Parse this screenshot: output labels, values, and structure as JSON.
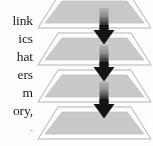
{
  "page": {
    "kind": "scanned-figure-fragment",
    "width": 153,
    "height": 146,
    "background": "#fdfdfc"
  },
  "text_column": {
    "name": "clipped-body-text",
    "alignment": "right",
    "lines": [
      {
        "text": "link",
        "top": 16
      },
      {
        "text": "ics",
        "top": 34
      },
      {
        "text": "hat",
        "top": 52
      },
      {
        "text": "ers",
        "top": 70
      },
      {
        "text": "m",
        "top": 88
      },
      {
        "text": "ory,",
        "top": 106
      },
      {
        "text": "-",
        "top": 124,
        "faint": true
      }
    ]
  },
  "diagram": {
    "name": "layered-stack-diagram",
    "type": "stacked-trapezoid-layers",
    "layer_count": 4,
    "arrow_count": 3,
    "layers": [
      {
        "label": "layer-1",
        "top": -6
      },
      {
        "label": "layer-2",
        "top": 31
      },
      {
        "label": "layer-3",
        "top": 68
      },
      {
        "label": "layer-4",
        "top": 105
      }
    ],
    "arrows": [
      {
        "label": "arrow-1",
        "top": 8,
        "left": 57
      },
      {
        "label": "arrow-2",
        "top": 45,
        "left": 57
      },
      {
        "label": "arrow-3",
        "top": 82,
        "left": 57
      }
    ],
    "colors": {
      "layer_outer_fill": "#fdfdfd",
      "layer_outline": "#a9a9a9",
      "layer_inner_fill": "#c9c9c9",
      "layer_inner_outline": "#bcbcbc",
      "arrow_head": "#141414",
      "arrow_shaft_top": "#b4b4b4",
      "arrow_shaft_bottom": "#161616"
    }
  }
}
